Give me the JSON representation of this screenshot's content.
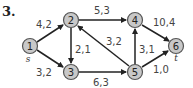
{
  "problem_number": "3.",
  "colors": {
    "node_fill": "#c8c8c8",
    "node_stroke": "#555555",
    "edge": "#222222",
    "text": "#444444"
  },
  "nodes": [
    {
      "id": "1",
      "label": "1",
      "sub": "s",
      "x": 30,
      "y": 46
    },
    {
      "id": "2",
      "label": "2",
      "sub": "",
      "x": 71,
      "y": 20
    },
    {
      "id": "3",
      "label": "3",
      "sub": "",
      "x": 71,
      "y": 72
    },
    {
      "id": "4",
      "label": "4",
      "sub": "",
      "x": 135,
      "y": 20
    },
    {
      "id": "5",
      "label": "5",
      "sub": "",
      "x": 135,
      "y": 72
    },
    {
      "id": "6",
      "label": "6",
      "sub": "t",
      "x": 176,
      "y": 46
    }
  ],
  "edges": [
    {
      "from": "1",
      "to": "2",
      "label": "4,2"
    },
    {
      "from": "1",
      "to": "3",
      "label": "3,2"
    },
    {
      "from": "2",
      "to": "3",
      "label": "2,1"
    },
    {
      "from": "2",
      "to": "4",
      "label": "5,3"
    },
    {
      "from": "5",
      "to": "2",
      "label": "3,2"
    },
    {
      "from": "3",
      "to": "5",
      "label": "6,3"
    },
    {
      "from": "5",
      "to": "4",
      "label": "3,1"
    },
    {
      "from": "4",
      "to": "6",
      "label": "10,4"
    },
    {
      "from": "5",
      "to": "6",
      "label": "1,0"
    }
  ]
}
